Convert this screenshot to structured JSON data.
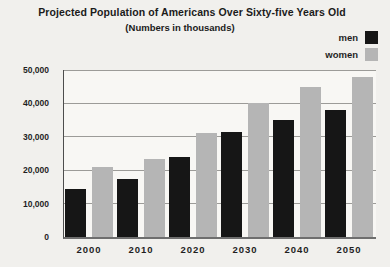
{
  "chart_data": {
    "type": "bar",
    "title": "Projected Population of Americans Over Sixty-five Years Old",
    "subtitle": "(Numbers in thousands)",
    "categories": [
      "2000",
      "2010",
      "2020",
      "2030",
      "2040",
      "2050"
    ],
    "series": [
      {
        "name": "men",
        "color": "#161616",
        "values": [
          14500,
          17500,
          24000,
          31500,
          35000,
          38000
        ]
      },
      {
        "name": "women",
        "color": "#b5b5b5",
        "values": [
          21000,
          23500,
          31000,
          40000,
          45000,
          48000
        ]
      }
    ],
    "xlabel": "",
    "ylabel": "",
    "ylim": [
      0,
      50000
    ],
    "yticks": [
      0,
      10000,
      20000,
      30000,
      40000,
      50000
    ],
    "ytick_labels": [
      "0",
      "10,000",
      "20,000",
      "30,000",
      "40,000",
      "50,000"
    ],
    "grid": true,
    "legend_position": "top-right"
  }
}
